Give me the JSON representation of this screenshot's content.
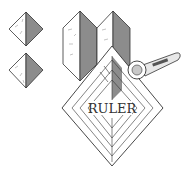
{
  "diagram": {
    "ruler_label": "RULER",
    "colors": {
      "line": "#333333",
      "fabric_light": "#ffffff",
      "fabric_dark": "#8c8c8c",
      "ruler_fill": "#ffffff",
      "cutter_handle": "#e8e8e8",
      "cutter_grip": "#555555",
      "cutter_blade": "#c8c8c8"
    },
    "elements": [
      {
        "name": "half-square-triangle-unit-1",
        "type": "diamond"
      },
      {
        "name": "half-square-triangle-unit-2",
        "type": "diamond"
      },
      {
        "name": "folded-fabric-panel-1",
        "type": "hexagon"
      },
      {
        "name": "folded-fabric-panel-2",
        "type": "hexagon"
      },
      {
        "name": "square-ruler",
        "type": "diamond",
        "label": "RULER"
      },
      {
        "name": "rotary-cutter",
        "type": "tool"
      }
    ]
  }
}
